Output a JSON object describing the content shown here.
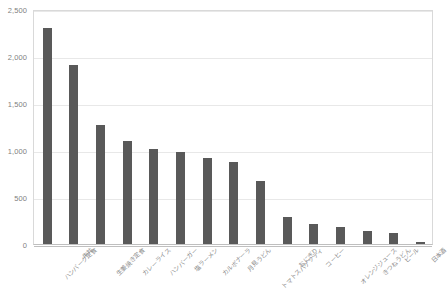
{
  "chart_data": {
    "type": "bar",
    "title": "",
    "xlabel": "",
    "ylabel": "",
    "ylim": [
      0,
      2500
    ],
    "ytick_values": [
      0,
      500,
      1000,
      1500,
      2000,
      2500
    ],
    "ytick_labels": [
      "0",
      "500",
      "1,000",
      "1,500",
      "2,000",
      "2,500"
    ],
    "grid": true,
    "legend": false,
    "bar_color": "#595959",
    "gridline_color": "#e8e8e8",
    "axis_color": "#bfbfbf",
    "tick_label_color": "#7f7f7f",
    "categories": [
      "ハンバーグ定食",
      "牛丼",
      "生姜焼き定食",
      "カレーライス",
      "ハンバーガー",
      "塩ラーメン",
      "カルボナーラ",
      "月見うどん",
      "トマトスパゲッティ",
      "おにぎり",
      "コーヒー",
      "オレンジジュース",
      "きつねうどん",
      "ビール",
      "日本酒"
    ],
    "values": [
      2300,
      1900,
      1270,
      1100,
      1010,
      980,
      920,
      870,
      670,
      290,
      215,
      180,
      135,
      120,
      25
    ],
    "series": [
      {
        "name": "売上数",
        "values": [
          2300,
          1900,
          1270,
          1100,
          1010,
          980,
          920,
          870,
          670,
          290,
          215,
          180,
          135,
          120,
          25
        ]
      }
    ]
  }
}
